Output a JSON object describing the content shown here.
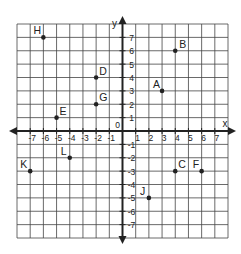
{
  "chart_data": {
    "type": "scatter",
    "title": "",
    "xlabel": "x",
    "ylabel": "y",
    "xlim": [
      -8,
      8
    ],
    "ylim": [
      -8,
      8
    ],
    "grid": true,
    "origin_label": "0",
    "x_ticks": [
      -7,
      -6,
      -5,
      -4,
      -3,
      -2,
      -1,
      1,
      2,
      3,
      4,
      5,
      6,
      7
    ],
    "y_ticks": [
      -7,
      -6,
      -5,
      -4,
      -3,
      -2,
      -1,
      1,
      2,
      3,
      4,
      5,
      6,
      7
    ],
    "points": [
      {
        "label": "A",
        "x": 3,
        "y": 3
      },
      {
        "label": "B",
        "x": 4,
        "y": 6
      },
      {
        "label": "C",
        "x": 4,
        "y": -3
      },
      {
        "label": "D",
        "x": -2,
        "y": 4
      },
      {
        "label": "E",
        "x": -5,
        "y": 1
      },
      {
        "label": "F",
        "x": 6,
        "y": -3
      },
      {
        "label": "G",
        "x": -2,
        "y": 2
      },
      {
        "label": "H",
        "x": -6,
        "y": 7
      },
      {
        "label": "J",
        "x": 2,
        "y": -5
      },
      {
        "label": "K",
        "x": -7,
        "y": -3
      },
      {
        "label": "L",
        "x": -4,
        "y": -2
      }
    ]
  },
  "colors": {
    "grid": "#444444",
    "axis": "#222222",
    "point": "#222222",
    "background": "#ffffff"
  }
}
